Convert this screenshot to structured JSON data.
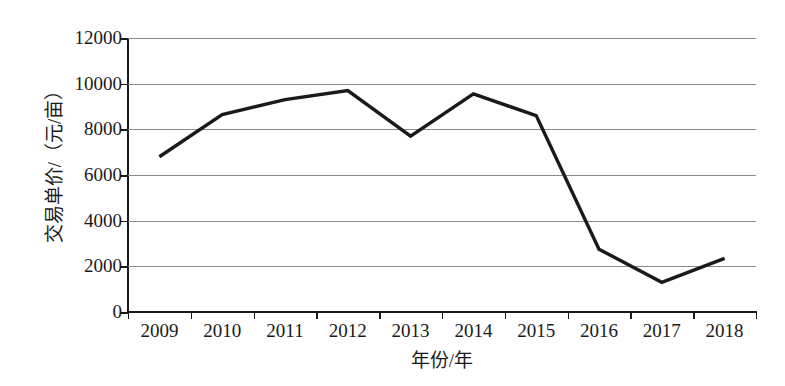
{
  "chart_data": {
    "type": "line",
    "title": "",
    "xlabel": "年份/年",
    "ylabel": "交易单价/（元/亩）",
    "categories": [
      "2009",
      "2010",
      "2011",
      "2012",
      "2013",
      "2014",
      "2015",
      "2016",
      "2017",
      "2018"
    ],
    "values": [
      6800,
      8650,
      9300,
      9700,
      7700,
      9550,
      8600,
      2750,
      1300,
      2350
    ],
    "series": [
      {
        "name": "交易单价",
        "values": [
          6800,
          8650,
          9300,
          9700,
          7700,
          9550,
          8600,
          2750,
          1300,
          2350
        ]
      }
    ],
    "ylim": [
      0,
      12000
    ],
    "y_ticks": [
      0,
      2000,
      4000,
      6000,
      8000,
      10000,
      12000
    ],
    "y_tick_labels": [
      "0",
      "2000",
      "4000",
      "6000",
      "8000",
      "10000",
      "12000"
    ],
    "grid": true,
    "legend": "none",
    "line_color": "#1a1a1a",
    "grid_color": "#8a8a8a",
    "axis_color": "#1a1a1a",
    "background_color": "#ffffff"
  }
}
